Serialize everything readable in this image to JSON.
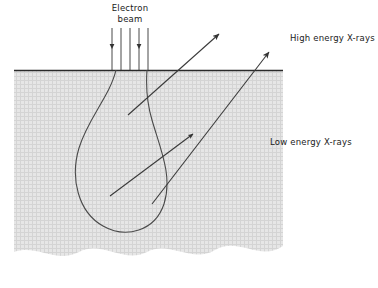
{
  "figure": {
    "title_absent": true,
    "kind": "electron-beam-interaction-volume-diagram",
    "labels": {
      "electron_beam_line1": "Electron",
      "electron_beam_line2": "beam",
      "high_energy_xrays": "High energy X-rays",
      "low_energy_xrays": "Low energy X-rays"
    },
    "colors": {
      "background": "#ffffff",
      "specimen_fill": "#e3e3e3",
      "specimen_stipple": "#cfcfcf",
      "stroke": "#333333",
      "surface_line": "#2b2b2b",
      "text": "#1a1a1a"
    },
    "geometry": {
      "specimen_left": 14,
      "specimen_right": 283,
      "surface_y": 70,
      "specimen_bottom_wave_y": 258,
      "beam_x_center": 130,
      "beam_line_count": 5,
      "beam_top_y": 28,
      "interaction_volume_top_y": 70,
      "interaction_volume_bottom_y": 232,
      "interaction_volume_left_x": 75,
      "interaction_volume_right_x": 163
    },
    "arrows": [
      {
        "name": "high-energy-xray-arrow-upper",
        "x1": 128,
        "y1": 115,
        "x2": 222,
        "y2": 32
      },
      {
        "name": "high-energy-xray-arrow-lower",
        "x1": 152,
        "y1": 204,
        "x2": 272,
        "y2": 50
      },
      {
        "name": "low-energy-xray-arrow",
        "x1": 110,
        "y1": 196,
        "x2": 196,
        "y2": 132
      }
    ]
  }
}
